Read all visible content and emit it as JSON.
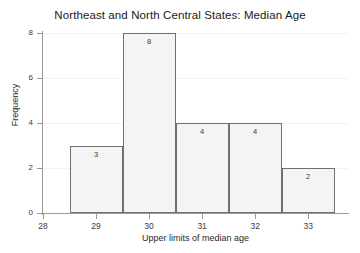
{
  "chart_data": {
    "type": "bar",
    "title": "Northeast and North Central States: Median Age",
    "xlabel": "Upper limits of median age",
    "ylabel": "Frequency",
    "categories": [
      "29",
      "30",
      "31",
      "32",
      "33"
    ],
    "bin_edges": [
      28.5,
      29.5,
      30.5,
      31.5,
      32.5,
      33.5
    ],
    "values": [
      3,
      8,
      4,
      4,
      2
    ],
    "bar_labels": [
      "3",
      "8",
      "4",
      "4",
      "2"
    ],
    "xlim": [
      28,
      33.75
    ],
    "ylim": [
      0,
      8
    ],
    "x_ticks": [
      "28",
      "29",
      "30",
      "31",
      "32",
      "33"
    ],
    "x_tick_values": [
      28,
      29,
      30,
      31,
      32,
      33
    ],
    "y_ticks": [
      "0",
      "2",
      "4",
      "6",
      "8"
    ],
    "y_tick_values": [
      0,
      2,
      4,
      6,
      8
    ],
    "grid": "horizontal-faint",
    "legend": "none",
    "bar_fill_color": "#f4f4f4",
    "bar_border_color": "#707070",
    "axis_color": "#9a9a9a",
    "text_color": "#2a2a2a",
    "background_color": "#ffffff"
  }
}
